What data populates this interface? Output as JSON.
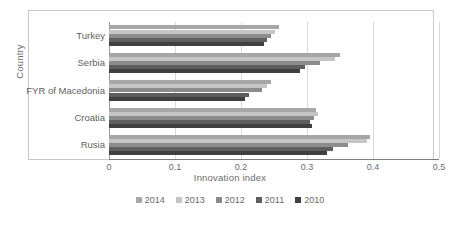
{
  "chart_data": {
    "type": "bar",
    "orientation": "horizontal",
    "title": "",
    "xlabel": "Innovation index",
    "ylabel": "Country",
    "categories": [
      "Turkey",
      "Serbia",
      "FYR of Macedonia",
      "Croatia",
      "Rusia"
    ],
    "xlim": [
      0,
      0.5
    ],
    "xticks": [
      "0",
      "0.1",
      "0.2",
      "0.3",
      "0.4",
      "0.5"
    ],
    "xtick_values": [
      0,
      0.1,
      0.2,
      0.3,
      0.4,
      0.5
    ],
    "grid": true,
    "legend_position": "bottom",
    "series": [
      {
        "name": "2014",
        "color": "#a6a6a6",
        "values": [
          0.258,
          0.35,
          0.245,
          0.313,
          0.395
        ]
      },
      {
        "name": "2013",
        "color": "#c5c5c5",
        "values": [
          0.252,
          0.342,
          0.24,
          0.317,
          0.391
        ]
      },
      {
        "name": "2012",
        "color": "#8c8c8c",
        "values": [
          0.245,
          0.32,
          0.232,
          0.31,
          0.362
        ]
      },
      {
        "name": "2011",
        "color": "#5e5e5e",
        "values": [
          0.24,
          0.297,
          0.212,
          0.305,
          0.34
        ]
      },
      {
        "name": "2010",
        "color": "#404040",
        "values": [
          0.235,
          0.29,
          0.206,
          0.308,
          0.33
        ]
      }
    ]
  }
}
